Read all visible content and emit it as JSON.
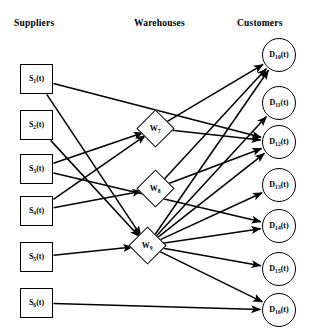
{
  "diagram": {
    "type": "network-flow-diagram",
    "columns": [
      {
        "key": "suppliers",
        "label": "Suppliers"
      },
      {
        "key": "warehouses",
        "label": "Warehouses"
      },
      {
        "key": "customers",
        "label": "Customers"
      }
    ],
    "suppliers": [
      {
        "id": "S1",
        "base": "S",
        "sub": "1",
        "arg": "(t)",
        "label": "S1(t)",
        "x": 20,
        "y": 64
      },
      {
        "id": "S2",
        "base": "S",
        "sub": "2",
        "arg": "(t)",
        "label": "S2(t)",
        "x": 20,
        "y": 110
      },
      {
        "id": "S3",
        "base": "S",
        "sub": "3",
        "arg": "(t)",
        "label": "S3(t)",
        "x": 20,
        "y": 154
      },
      {
        "id": "S4",
        "base": "S",
        "sub": "4",
        "arg": "(t)",
        "label": "S4(t)",
        "x": 20,
        "y": 196
      },
      {
        "id": "S5",
        "base": "S",
        "sub": "5",
        "arg": "(t)",
        "label": "S5(t)",
        "x": 20,
        "y": 242
      },
      {
        "id": "S6",
        "base": "S",
        "sub": "6",
        "arg": "(t)",
        "label": "S6(t)",
        "x": 20,
        "y": 288
      }
    ],
    "warehouses": [
      {
        "id": "W7",
        "base": "W",
        "sub": "7",
        "arg": "",
        "label": "W7",
        "x": 142,
        "y": 115
      },
      {
        "id": "W8",
        "base": "W",
        "sub": "8",
        "arg": "",
        "label": "W8",
        "x": 142,
        "y": 175
      },
      {
        "id": "W9",
        "base": "W",
        "sub": "9",
        "arg": "",
        "label": "W9",
        "x": 134,
        "y": 232
      }
    ],
    "customers": [
      {
        "id": "D10",
        "base": "D",
        "sub": "10",
        "arg": "(t)",
        "label": "D10(t)",
        "x": 262,
        "y": 38
      },
      {
        "id": "D11",
        "base": "D",
        "sub": "11",
        "arg": "(t)",
        "label": "D11(t)",
        "x": 262,
        "y": 86
      },
      {
        "id": "D12",
        "base": "D",
        "sub": "12",
        "arg": "(t)",
        "label": "D12(t)",
        "x": 262,
        "y": 125
      },
      {
        "id": "D13",
        "base": "D",
        "sub": "13",
        "arg": "(t)",
        "label": "D13(t)",
        "x": 262,
        "y": 168
      },
      {
        "id": "D14",
        "base": "D",
        "sub": "14",
        "arg": "(t)",
        "label": "D14(t)",
        "x": 262,
        "y": 209
      },
      {
        "id": "D15",
        "base": "D",
        "sub": "15",
        "arg": "(t)",
        "label": "D15(t)",
        "x": 262,
        "y": 252
      },
      {
        "id": "D16",
        "base": "D",
        "sub": "16",
        "arg": "(t)",
        "label": "D16(t)",
        "x": 262,
        "y": 293
      }
    ],
    "edges": [
      {
        "from": "S1",
        "to": "W9"
      },
      {
        "from": "S1",
        "to": "D12"
      },
      {
        "from": "S2",
        "to": "W9"
      },
      {
        "from": "S3",
        "to": "W7"
      },
      {
        "from": "S3",
        "to": "D14"
      },
      {
        "from": "S4",
        "to": "W7"
      },
      {
        "from": "S4",
        "to": "W8"
      },
      {
        "from": "S5",
        "to": "W9"
      },
      {
        "from": "S6",
        "to": "D16"
      },
      {
        "from": "W7",
        "to": "D10"
      },
      {
        "from": "W7",
        "to": "D12"
      },
      {
        "from": "W8",
        "to": "D10"
      },
      {
        "from": "W8",
        "to": "D12"
      },
      {
        "from": "W9",
        "to": "D10"
      },
      {
        "from": "W9",
        "to": "D11"
      },
      {
        "from": "W9",
        "to": "D12"
      },
      {
        "from": "W9",
        "to": "D13"
      },
      {
        "from": "W9",
        "to": "D14"
      },
      {
        "from": "W9",
        "to": "D15"
      },
      {
        "from": "W9",
        "to": "D16"
      }
    ],
    "style": {
      "edge_color": "#000000",
      "edge_width": 1.5,
      "node_stroke": "#000000",
      "node_fill": "#ffffff",
      "background": "#ffffff"
    }
  }
}
